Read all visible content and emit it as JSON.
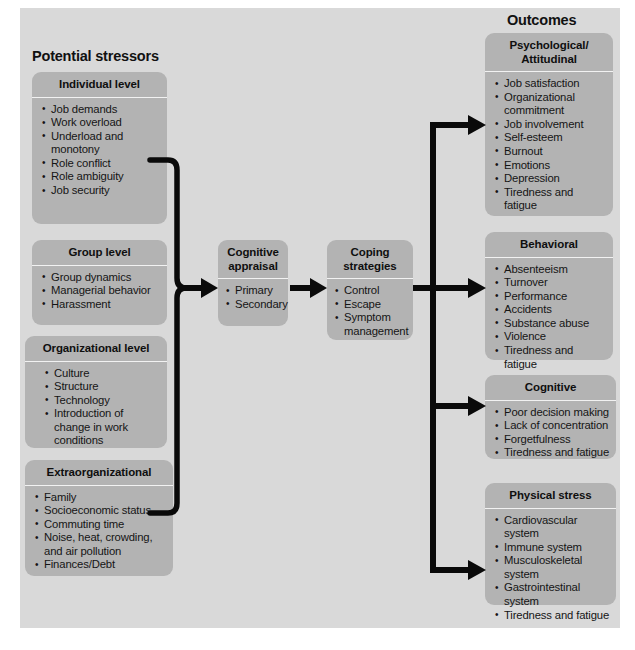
{
  "titles": {
    "stressors": "Potential stressors",
    "outcomes": "Outcomes"
  },
  "colors": {
    "background": "#d9d9d9",
    "box": "#b3b3b3",
    "divider": "#f2f2f2",
    "arrow": "#000000",
    "text": "#151515"
  },
  "stressors": [
    {
      "id": "individual-level",
      "header": "Individual level",
      "items": [
        "Job demands",
        "Work overload",
        "Underload and monotony",
        "Role conflict",
        "Role ambiguity",
        "Job security"
      ]
    },
    {
      "id": "group-level",
      "header": "Group level",
      "items": [
        "Group dynamics",
        "Managerial behavior",
        "Harassment"
      ]
    },
    {
      "id": "organizational-level",
      "header": "Organizational level",
      "items": [
        "Culture",
        "Structure",
        "Technology",
        "Introduction of change in work conditions"
      ]
    },
    {
      "id": "extraorganizational",
      "header": "Extraorganizational",
      "items": [
        "Family",
        "Socioeconomic status",
        "Commuting time",
        "Noise, heat, crowding, and air pollution",
        "Finances/Debt"
      ]
    }
  ],
  "process": [
    {
      "id": "cognitive-appraisal",
      "header": "Cognitive appraisal",
      "items": [
        "Primary",
        "Secondary"
      ]
    },
    {
      "id": "coping-strategies",
      "header": "Coping strategies",
      "items": [
        "Control",
        "Escape",
        "Symptom management"
      ]
    }
  ],
  "outcomes": [
    {
      "id": "psychological-attitudinal",
      "header": "Psychological/ Attitudinal",
      "items": [
        "Job satisfaction",
        "Organizational commitment",
        "Job involvement",
        "Self-esteem",
        "Burnout",
        "Emotions",
        "Depression",
        "Tiredness and fatigue"
      ]
    },
    {
      "id": "behavioral",
      "header": "Behavioral",
      "items": [
        "Absenteeism",
        "Turnover",
        "Performance",
        "Accidents",
        "Substance abuse",
        "Violence",
        "Tiredness and fatigue"
      ]
    },
    {
      "id": "cognitive",
      "header": "Cognitive",
      "items": [
        "Poor decision making",
        "Lack of concentration",
        "Forgetfulness",
        "Tiredness and fatigue"
      ]
    },
    {
      "id": "physical-stress",
      "header": "Physical stress",
      "items": [
        "Cardiovascular system",
        "Immune system",
        "Musculoskeletal system",
        "Gastrointestinal system",
        "Tiredness and fatigue"
      ]
    }
  ]
}
